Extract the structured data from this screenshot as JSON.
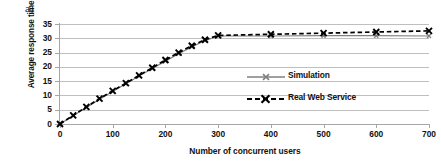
{
  "figure": {
    "panel_label": "a)"
  },
  "chart_data": {
    "type": "line",
    "title": "",
    "xlabel": "Number of concurrent users",
    "ylabel": "Average response time [s]",
    "xlim": [
      0,
      700
    ],
    "ylim": [
      0,
      35
    ],
    "xticks": [
      0,
      100,
      200,
      300,
      400,
      500,
      600,
      700
    ],
    "yticks": [
      0,
      5,
      10,
      15,
      20,
      25,
      30,
      35
    ],
    "grid": "horizontal",
    "legend_position": "center-right-inside",
    "colors": {
      "simulation": "#808080",
      "real_web_service": "#000000",
      "gridline": "#bfbfbf",
      "axis": "#a6a6a6",
      "background": "#ffffff"
    },
    "series": [
      {
        "name": "Simulation",
        "style": "solid",
        "marker": "cross-small",
        "color": "#808080",
        "x": [
          0,
          25,
          50,
          75,
          100,
          125,
          150,
          175,
          200,
          225,
          250,
          275,
          300,
          400,
          500,
          600,
          700
        ],
        "values": [
          0,
          2.9,
          5.8,
          8.7,
          11.4,
          14.1,
          16.8,
          19.4,
          22.0,
          24.6,
          27.0,
          29.2,
          30.8,
          30.8,
          30.9,
          30.9,
          30.8
        ]
      },
      {
        "name": "Real Web Service",
        "style": "dashed",
        "marker": "cross",
        "color": "#000000",
        "x": [
          0,
          25,
          50,
          75,
          100,
          125,
          150,
          175,
          200,
          225,
          250,
          275,
          300,
          400,
          500,
          600,
          700
        ],
        "values": [
          0,
          3.0,
          6.0,
          8.9,
          11.6,
          14.3,
          17.0,
          19.7,
          22.4,
          25.0,
          27.4,
          29.5,
          31.0,
          31.4,
          31.8,
          32.2,
          32.6
        ]
      }
    ]
  }
}
